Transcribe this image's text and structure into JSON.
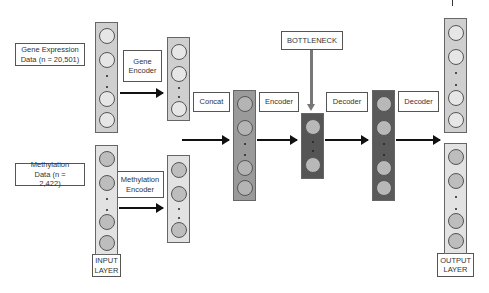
{
  "labels": {
    "gene_expression": "Gene Expression Data (n = 20,501)",
    "methylation": "Methylation Data (n = 2,422)",
    "gene_encoder": "Gene Encoder",
    "methylation_encoder": "Methylation Encoder",
    "concat": "Concat",
    "encoder": "Encoder",
    "bottleneck": "BOTTLENECK",
    "decoder_1": "Decoder",
    "decoder_2": "Decoder",
    "input_layer": "INPUT LAYER",
    "output_layer": "OUTPUT LAYER"
  },
  "colors": {
    "input_layer_bg": "#cfcfcf",
    "input_node": "#e6e6e6",
    "input_meth_bg": "#e2e2e2",
    "input_meth_node": "#bdbdbd",
    "concat_bg": "#9a9a9a",
    "concat_node": "#b4b4b4",
    "bottleneck_bg": "#555555",
    "bottleneck_node": "#b8b8b8",
    "decoder_bg": "#5a5a5a",
    "decoder_node": "#b8b8b8"
  }
}
